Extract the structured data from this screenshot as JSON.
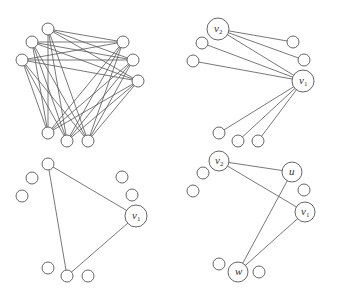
{
  "figure": {
    "panels": [
      {
        "id": "complete-tripartite",
        "nodes": [
          {
            "id": "a",
            "label": ""
          },
          {
            "id": "b",
            "label": ""
          },
          {
            "id": "c",
            "label": ""
          },
          {
            "id": "d",
            "label": ""
          },
          {
            "id": "e",
            "label": ""
          },
          {
            "id": "f",
            "label": ""
          },
          {
            "id": "g",
            "label": ""
          },
          {
            "id": "h",
            "label": ""
          },
          {
            "id": "i",
            "label": ""
          }
        ],
        "edges": [
          [
            "a",
            "d"
          ],
          [
            "a",
            "e"
          ],
          [
            "a",
            "f"
          ],
          [
            "b",
            "d"
          ],
          [
            "b",
            "e"
          ],
          [
            "b",
            "f"
          ],
          [
            "c",
            "d"
          ],
          [
            "c",
            "e"
          ],
          [
            "c",
            "f"
          ],
          [
            "a",
            "g"
          ],
          [
            "a",
            "h"
          ],
          [
            "a",
            "i"
          ],
          [
            "b",
            "g"
          ],
          [
            "b",
            "h"
          ],
          [
            "b",
            "i"
          ],
          [
            "c",
            "g"
          ],
          [
            "c",
            "h"
          ],
          [
            "c",
            "i"
          ],
          [
            "d",
            "g"
          ],
          [
            "d",
            "h"
          ],
          [
            "d",
            "i"
          ],
          [
            "e",
            "g"
          ],
          [
            "e",
            "h"
          ],
          [
            "e",
            "i"
          ],
          [
            "f",
            "g"
          ],
          [
            "f",
            "h"
          ],
          [
            "f",
            "i"
          ]
        ]
      },
      {
        "id": "star-v1-v2",
        "nodes": [
          {
            "id": "v2",
            "label": "v",
            "sub": "2"
          },
          {
            "id": "b",
            "label": ""
          },
          {
            "id": "c",
            "label": ""
          },
          {
            "id": "d",
            "label": ""
          },
          {
            "id": "e",
            "label": ""
          },
          {
            "id": "v1",
            "label": "v",
            "sub": "1"
          },
          {
            "id": "g",
            "label": ""
          },
          {
            "id": "h",
            "label": ""
          },
          {
            "id": "i",
            "label": ""
          }
        ],
        "edges": [
          [
            "v2",
            "d"
          ],
          [
            "v2",
            "e"
          ],
          [
            "v2",
            "v1"
          ],
          [
            "b",
            "v1"
          ],
          [
            "c",
            "v1"
          ],
          [
            "v1",
            "g"
          ],
          [
            "v1",
            "h"
          ],
          [
            "v1",
            "i"
          ]
        ]
      },
      {
        "id": "triangle",
        "nodes": [
          {
            "id": "a",
            "label": ""
          },
          {
            "id": "b",
            "label": ""
          },
          {
            "id": "c",
            "label": ""
          },
          {
            "id": "d",
            "label": ""
          },
          {
            "id": "e",
            "label": ""
          },
          {
            "id": "v1",
            "label": "v",
            "sub": "1"
          },
          {
            "id": "g",
            "label": ""
          },
          {
            "id": "h",
            "label": ""
          },
          {
            "id": "i",
            "label": ""
          }
        ],
        "edges": [
          [
            "a",
            "v1"
          ],
          [
            "a",
            "h"
          ],
          [
            "h",
            "v1"
          ]
        ]
      },
      {
        "id": "four-cycle",
        "nodes": [
          {
            "id": "v2",
            "label": "v",
            "sub": "2"
          },
          {
            "id": "b",
            "label": ""
          },
          {
            "id": "c",
            "label": ""
          },
          {
            "id": "u",
            "label": "u"
          },
          {
            "id": "e",
            "label": ""
          },
          {
            "id": "v1",
            "label": "v",
            "sub": "1"
          },
          {
            "id": "g",
            "label": ""
          },
          {
            "id": "w",
            "label": "w"
          },
          {
            "id": "i",
            "label": ""
          }
        ],
        "edges": [
          [
            "v2",
            "u"
          ],
          [
            "v2",
            "v1"
          ],
          [
            "u",
            "w"
          ],
          [
            "v1",
            "w"
          ]
        ]
      }
    ]
  }
}
